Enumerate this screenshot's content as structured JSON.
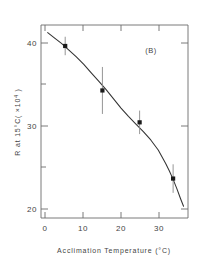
{
  "chart_data": {
    "type": "scatter",
    "title": "",
    "panel_label": "(B)",
    "xlabel": "Acclimation Temperature (°C)",
    "ylabel": "R at 15°C ( ×10⁴ )",
    "xlim": [
      -1.5,
      38
    ],
    "ylim": [
      18.5,
      41.5
    ],
    "xticks": [
      0,
      10,
      20,
      30
    ],
    "xtick_labels": [
      "0",
      "10",
      "20",
      "30"
    ],
    "yticks": [
      20,
      30,
      40
    ],
    "ytick_labels": [
      "20",
      "30",
      "40"
    ],
    "y_minor_ticks": [
      25,
      35
    ],
    "grid": false,
    "legend": null,
    "series": [
      {
        "name": "R at 15°C",
        "marker": "square",
        "marker_color": "#1a1a1a",
        "x": [
          5,
          15,
          25,
          34
        ],
        "y": [
          39.0,
          33.7,
          29.9,
          23.2
        ],
        "yerr_low": [
          37.9,
          30.9,
          28.5,
          21.5
        ],
        "yerr_high": [
          40.1,
          36.5,
          31.3,
          24.9
        ]
      }
    ],
    "fit_curve": {
      "name": "fitted curve",
      "color": "#333333",
      "x": [
        0.3,
        2,
        4,
        6,
        8,
        10,
        12,
        14,
        16,
        18,
        20,
        22,
        24,
        26,
        28,
        30,
        31,
        32,
        33,
        34,
        35,
        36,
        36.8
      ],
      "y": [
        40.6,
        40.0,
        39.3,
        38.5,
        37.7,
        36.8,
        35.8,
        34.8,
        33.8,
        32.7,
        31.6,
        30.6,
        29.7,
        28.8,
        27.8,
        26.6,
        25.8,
        25.0,
        24.1,
        23.1,
        22.0,
        20.8,
        19.9
      ]
    }
  },
  "axis_labels": {
    "x_title": "Acclimation Temperature (°C)",
    "y_title_main": "R at 15°C",
    "y_title_unit": "( ×10",
    "y_title_exp": "4",
    "y_title_close": " )"
  },
  "style": {
    "axis_color": "#6b6b6b",
    "text_color": "#444444",
    "marker_color": "#1a1a1a",
    "curve_color": "#333333",
    "errorbar_color": "#8a8a8a",
    "background": "#ffffff"
  }
}
